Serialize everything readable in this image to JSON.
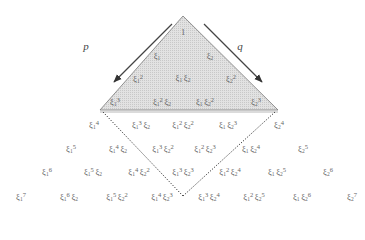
{
  "diagram": {
    "arrows": [
      {
        "label": "p",
        "x": 86,
        "y": 46
      },
      {
        "label": "q",
        "x": 240,
        "y": 46
      }
    ],
    "triangle_fill": "#d9d9d9",
    "terms": [
      {
        "id": "t0",
        "x": 183,
        "y": 32,
        "base": [],
        "text": "1"
      },
      {
        "id": "t1a",
        "x": 157,
        "y": 57,
        "parts": [
          [
            "1",
            ""
          ]
        ]
      },
      {
        "id": "t1b",
        "x": 210,
        "y": 57,
        "parts": [
          [
            "2",
            ""
          ]
        ]
      },
      {
        "id": "t2a",
        "x": 138,
        "y": 79,
        "parts": [
          [
            "1",
            "2"
          ]
        ]
      },
      {
        "id": "t2b",
        "x": 183,
        "y": 79,
        "parts": [
          [
            "1",
            ""
          ],
          [
            "2",
            ""
          ]
        ]
      },
      {
        "id": "t2c",
        "x": 231,
        "y": 79,
        "parts": [
          [
            "2",
            "2"
          ]
        ]
      },
      {
        "id": "t3a",
        "x": 115,
        "y": 102,
        "parts": [
          [
            "1",
            "3"
          ]
        ]
      },
      {
        "id": "t3b",
        "x": 162,
        "y": 102,
        "parts": [
          [
            "1",
            "2"
          ],
          [
            "2",
            ""
          ]
        ]
      },
      {
        "id": "t3c",
        "x": 205,
        "y": 102,
        "parts": [
          [
            "1",
            ""
          ],
          [
            "2",
            "2"
          ]
        ]
      },
      {
        "id": "t3d",
        "x": 256,
        "y": 102,
        "parts": [
          [
            "2",
            "3"
          ]
        ]
      },
      {
        "id": "t4a",
        "x": 94,
        "y": 125,
        "parts": [
          [
            "1",
            "4"
          ]
        ]
      },
      {
        "id": "t4b",
        "x": 141,
        "y": 125,
        "parts": [
          [
            "1",
            "3"
          ],
          [
            "2",
            ""
          ]
        ]
      },
      {
        "id": "t4c",
        "x": 183,
        "y": 125,
        "parts": [
          [
            "1",
            "2"
          ],
          [
            "2",
            "2"
          ]
        ]
      },
      {
        "id": "t4d",
        "x": 228,
        "y": 125,
        "parts": [
          [
            "1",
            ""
          ],
          [
            "2",
            "3"
          ]
        ]
      },
      {
        "id": "t4e",
        "x": 279,
        "y": 125,
        "parts": [
          [
            "2",
            "4"
          ]
        ]
      },
      {
        "id": "t5a",
        "x": 71,
        "y": 149,
        "parts": [
          [
            "1",
            "5"
          ]
        ]
      },
      {
        "id": "t5b",
        "x": 118,
        "y": 149,
        "parts": [
          [
            "1",
            "4"
          ],
          [
            "2",
            ""
          ]
        ]
      },
      {
        "id": "t5c",
        "x": 163,
        "y": 149,
        "parts": [
          [
            "1",
            "3"
          ],
          [
            "2",
            "2"
          ]
        ]
      },
      {
        "id": "t5d",
        "x": 205,
        "y": 149,
        "parts": [
          [
            "1",
            "2"
          ],
          [
            "2",
            "3"
          ]
        ]
      },
      {
        "id": "t5e",
        "x": 251,
        "y": 149,
        "parts": [
          [
            "1",
            ""
          ],
          [
            "2",
            "4"
          ]
        ]
      },
      {
        "id": "t5f",
        "x": 303,
        "y": 149,
        "parts": [
          [
            "2",
            "5"
          ]
        ]
      },
      {
        "id": "t6a",
        "x": 47,
        "y": 172,
        "parts": [
          [
            "1",
            "6"
          ]
        ]
      },
      {
        "id": "t6b",
        "x": 93,
        "y": 172,
        "parts": [
          [
            "1",
            "5"
          ],
          [
            "2",
            ""
          ]
        ]
      },
      {
        "id": "t6c",
        "x": 139,
        "y": 172,
        "parts": [
          [
            "1",
            "4"
          ],
          [
            "2",
            "2"
          ]
        ]
      },
      {
        "id": "t6d",
        "x": 183,
        "y": 172,
        "parts": [
          [
            "1",
            "3"
          ],
          [
            "2",
            "3"
          ]
        ]
      },
      {
        "id": "t6e",
        "x": 230,
        "y": 172,
        "parts": [
          [
            "1",
            "2"
          ],
          [
            "2",
            "4"
          ]
        ]
      },
      {
        "id": "t6f",
        "x": 277,
        "y": 172,
        "parts": [
          [
            "1",
            ""
          ],
          [
            "2",
            "5"
          ]
        ]
      },
      {
        "id": "t6g",
        "x": 328,
        "y": 172,
        "parts": [
          [
            "2",
            "6"
          ]
        ]
      },
      {
        "id": "t7a",
        "x": 21,
        "y": 197,
        "parts": [
          [
            "1",
            "7"
          ]
        ]
      },
      {
        "id": "t7b",
        "x": 69,
        "y": 197,
        "parts": [
          [
            "1",
            "6"
          ],
          [
            "2",
            ""
          ]
        ]
      },
      {
        "id": "t7c",
        "x": 117,
        "y": 197,
        "parts": [
          [
            "1",
            "5"
          ],
          [
            "2",
            "2"
          ]
        ]
      },
      {
        "id": "t7d",
        "x": 162,
        "y": 197,
        "parts": [
          [
            "1",
            "4"
          ],
          [
            "2",
            "3"
          ]
        ]
      },
      {
        "id": "t7e",
        "x": 209,
        "y": 197,
        "parts": [
          [
            "1",
            "3"
          ],
          [
            "2",
            "4"
          ]
        ]
      },
      {
        "id": "t7f",
        "x": 254,
        "y": 197,
        "parts": [
          [
            "1",
            "2"
          ],
          [
            "2",
            "5"
          ]
        ]
      },
      {
        "id": "t7g",
        "x": 302,
        "y": 197,
        "parts": [
          [
            "1",
            ""
          ],
          [
            "2",
            "6"
          ]
        ]
      },
      {
        "id": "t7h",
        "x": 352,
        "y": 197,
        "parts": [
          [
            "2",
            "7"
          ]
        ]
      }
    ]
  }
}
